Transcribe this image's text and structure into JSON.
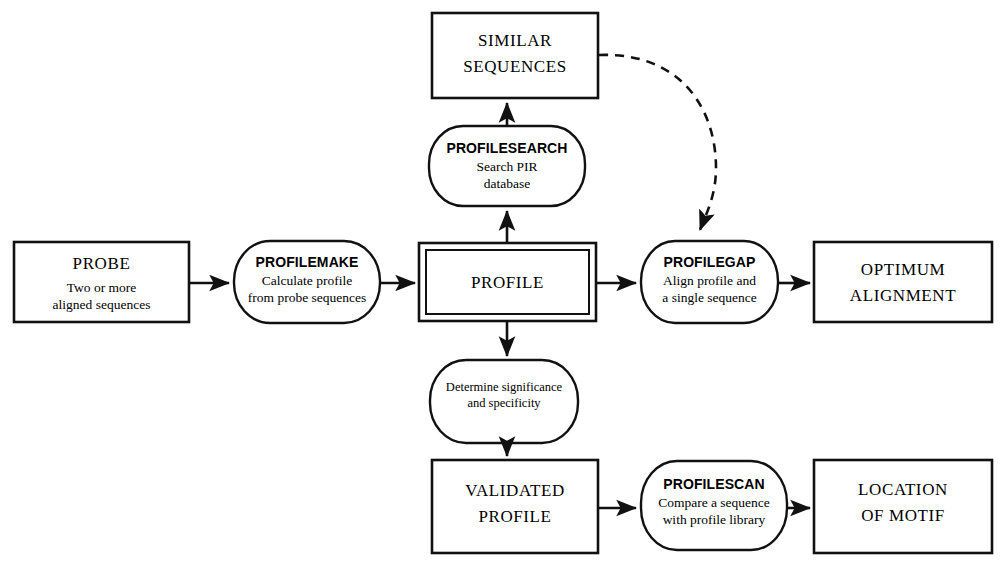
{
  "diagram": {
    "background_color": "#ffffff",
    "line_color": "#111111",
    "nodes": {
      "similar_sequences": {
        "shape": "rectangle",
        "line1": "SIMILAR",
        "line2": "SEQUENCES"
      },
      "profilesearch": {
        "shape": "rounded",
        "name": "PROFILESEARCH",
        "desc_line1": "Search PIR",
        "desc_line2": "database"
      },
      "probe": {
        "shape": "rectangle",
        "name": "PROBE",
        "desc_line1": "Two or more",
        "desc_line2": "aligned sequences"
      },
      "profilemake": {
        "shape": "rounded",
        "name": "PROFILEMAKE",
        "desc_line1": "Calculate profile",
        "desc_line2": "from probe sequences"
      },
      "profile": {
        "shape": "double-rectangle",
        "name": "PROFILE"
      },
      "profilegap": {
        "shape": "rounded",
        "name": "PROFILEGAP",
        "desc_line1": "Align profile and",
        "desc_line2": "a single sequence"
      },
      "optimum_alignment": {
        "shape": "rectangle",
        "line1": "OPTIMUM",
        "line2": "ALIGNMENT"
      },
      "determine": {
        "shape": "rounded",
        "desc_line1": "Determine significance",
        "desc_line2": "and specificity"
      },
      "validated_profile": {
        "shape": "rectangle",
        "line1": "VALIDATED",
        "line2": "PROFILE"
      },
      "profilescan": {
        "shape": "rounded",
        "name": "PROFILESCAN",
        "desc_line1": "Compare a sequence",
        "desc_line2": "with profile library"
      },
      "location_of_motif": {
        "shape": "rectangle",
        "line1": "LOCATION",
        "line2": "OF MOTIF"
      }
    },
    "edges": [
      {
        "id": "probe-to-profilemake",
        "from": "probe",
        "to": "profilemake",
        "style": "solid",
        "arrow": "end"
      },
      {
        "id": "profilemake-to-profile",
        "from": "profilemake",
        "to": "profile",
        "style": "solid",
        "arrow": "end"
      },
      {
        "id": "profile-to-profilesearch",
        "from": "profile",
        "to": "profilesearch",
        "style": "solid",
        "arrow": "end"
      },
      {
        "id": "profilesearch-to-similar",
        "from": "profilesearch",
        "to": "similar_sequences",
        "style": "solid",
        "arrow": "end"
      },
      {
        "id": "similar-to-profilegap",
        "from": "similar_sequences",
        "to": "profilegap",
        "style": "dashed",
        "arrow": "end"
      },
      {
        "id": "profile-to-profilegap",
        "from": "profile",
        "to": "profilegap",
        "style": "solid",
        "arrow": "end"
      },
      {
        "id": "profilegap-to-optimum",
        "from": "profilegap",
        "to": "optimum_alignment",
        "style": "solid",
        "arrow": "end"
      },
      {
        "id": "profile-to-determine",
        "from": "profile",
        "to": "determine",
        "style": "solid",
        "arrow": "end"
      },
      {
        "id": "determine-to-validated",
        "from": "determine",
        "to": "validated_profile",
        "style": "solid",
        "arrow": "end"
      },
      {
        "id": "validated-to-profilescan",
        "from": "validated_profile",
        "to": "profilescan",
        "style": "solid",
        "arrow": "end"
      },
      {
        "id": "profilescan-to-location",
        "from": "profilescan",
        "to": "location_of_motif",
        "style": "solid",
        "arrow": "end"
      }
    ]
  }
}
